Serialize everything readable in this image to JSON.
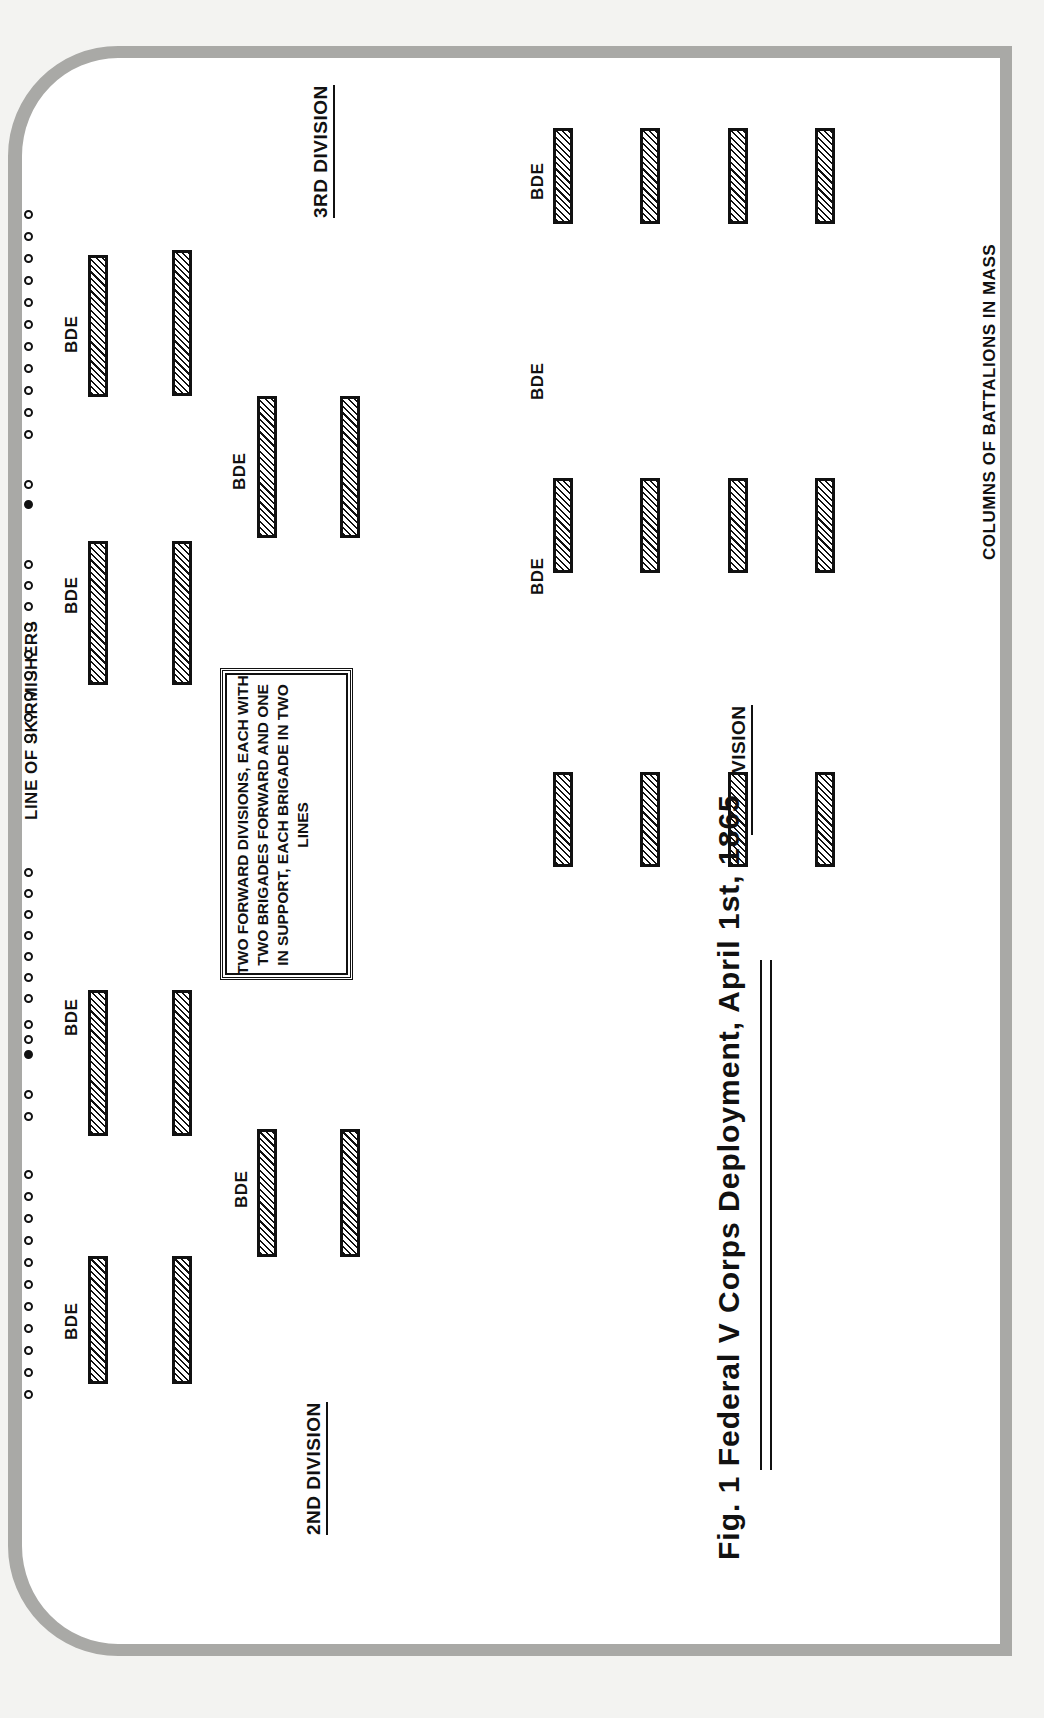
{
  "figure": {
    "title": "Fig. 1   Federal V Corps Deployment, April 1st, 1865",
    "note": "TWO FORWARD DIVISIONS, EACH WITH TWO BRIGADES FORWARD AND ONE IN SUPPORT, EACH BRIGADE IN TWO LINES",
    "skirmish_label": "LINE OF SKIRMISHERS",
    "columns_label": "COLUMNS OF BATTALIONS IN MASS"
  },
  "divisions": {
    "second": {
      "label": "2ND  DIVISION"
    },
    "third": {
      "label": "3RD  DIVISION"
    },
    "first": {
      "label": "1ST  DIVISION"
    }
  },
  "brigade_label": "BDE",
  "colors": {
    "ink": "#111111",
    "paper": "#ffffff",
    "border": "#a9a9a6"
  }
}
